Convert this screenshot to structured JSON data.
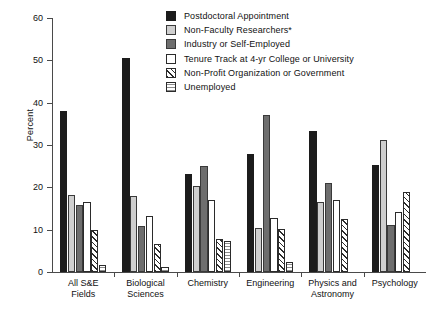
{
  "chart_data": {
    "type": "bar",
    "title": "",
    "xlabel": "",
    "ylabel": "Percent",
    "ylim": [
      0,
      60
    ],
    "yticks": [
      0,
      10,
      20,
      30,
      40,
      50,
      60
    ],
    "grid": false,
    "legend_position": "top-right-inside",
    "categories": [
      "All S&E\nFields",
      "Biological\nSciences",
      "Chemistry",
      "Engineering",
      "Physics and\nAstronomy",
      "Psychology"
    ],
    "category_lines": [
      [
        "All S&E",
        "Fields"
      ],
      [
        "Biological",
        "Sciences"
      ],
      [
        "Chemistry"
      ],
      [
        "Engineering"
      ],
      [
        "Physics and",
        "Astronomy"
      ],
      [
        "Psychology"
      ]
    ],
    "series": [
      {
        "name": "Postdoctoral Appointment",
        "style": "solid-black",
        "color": "#1c1c1c",
        "values": [
          38.1,
          50.5,
          23.1,
          27.8,
          33.3,
          25.3
        ]
      },
      {
        "name": "Non-Faculty Researchers*",
        "style": "solid-light-gray",
        "color": "#cfcfcf",
        "values": [
          18.3,
          17.9,
          20.3,
          10.4,
          16.5,
          31.2
        ]
      },
      {
        "name": "Industry or Self-Employed",
        "style": "solid-dark-gray",
        "color": "#6e6e6e",
        "values": [
          15.8,
          10.9,
          25.0,
          37.0,
          21.1,
          11.0
        ]
      },
      {
        "name": "Tenure Track at 4-yr College or University",
        "style": "open-white",
        "color": "#ffffff",
        "values": [
          16.5,
          13.3,
          16.9,
          12.8,
          16.9,
          14.1
        ]
      },
      {
        "name": "Non-Profit Organization or Government",
        "style": "diagonal-hatch",
        "color": "#2b2b2b",
        "values": [
          10.0,
          6.7,
          7.8,
          10.2,
          12.6,
          19.0
        ]
      },
      {
        "name": "Unemployed",
        "style": "dotted-grid",
        "color": "#8a8a8a",
        "values": [
          1.6,
          1.3,
          7.3,
          2.4,
          0,
          0
        ]
      }
    ]
  }
}
